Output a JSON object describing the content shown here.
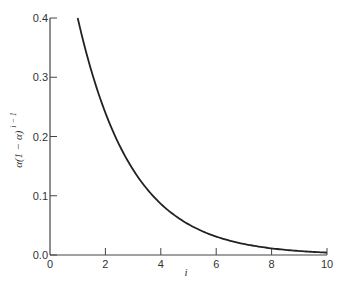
{
  "chart_data": {
    "type": "line",
    "title": "",
    "xlabel": "i",
    "ylabel": "α(1 − α)",
    "ylabel_superscript": "i − 1",
    "xlim": [
      0,
      10
    ],
    "ylim": [
      0,
      0.4
    ],
    "x_ticks": [
      0,
      2,
      4,
      6,
      8,
      10
    ],
    "x_tick_labels": [
      "0",
      "2",
      "4",
      "6",
      "8",
      "10"
    ],
    "y_ticks": [
      0.0,
      0.1,
      0.2,
      0.3,
      0.4
    ],
    "y_tick_labels": [
      "0.0",
      "0.1",
      "0.2",
      "0.3",
      "0.4"
    ],
    "grid": false,
    "legend": "none",
    "series": [
      {
        "name": "α(1 − α)^(i−1), α = 0.4",
        "alpha": 0.4,
        "x": [
          1,
          1.5,
          2,
          2.5,
          3,
          3.5,
          4,
          4.5,
          5,
          5.5,
          6,
          6.5,
          7,
          7.5,
          8,
          8.5,
          9,
          9.5,
          10
        ],
        "values": [
          0.4,
          0.31,
          0.24,
          0.186,
          0.144,
          0.112,
          0.0864,
          0.067,
          0.0518,
          0.0402,
          0.0311,
          0.0241,
          0.0187,
          0.0145,
          0.0112,
          0.0087,
          0.0067,
          0.0052,
          0.004
        ]
      }
    ]
  }
}
